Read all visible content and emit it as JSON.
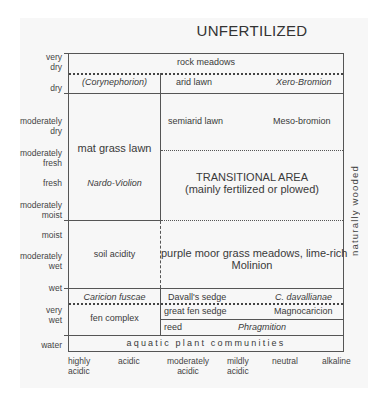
{
  "title": "UNFERTILIZED",
  "side_label": "naturally wooded",
  "y_axis": [
    {
      "label": "very\ndry",
      "line1": "very",
      "line2": "dry"
    },
    {
      "label": "dry"
    },
    {
      "line1": "moderately",
      "line2": "dry"
    },
    {
      "line1": "moderately",
      "line2": "fresh"
    },
    {
      "label": "fresh"
    },
    {
      "line1": "moderately",
      "line2": "moist"
    },
    {
      "label": "moist"
    },
    {
      "line1": "moderately",
      "line2": "wet"
    },
    {
      "label": "wet"
    },
    {
      "line1": "very",
      "line2": "wet"
    },
    {
      "label": "water"
    }
  ],
  "x_axis": [
    {
      "line1": "highly",
      "line2": "acidic"
    },
    {
      "line1": "acidic",
      "line2": ""
    },
    {
      "line1": "moderately",
      "line2": "acidic"
    },
    {
      "line1": "mildly",
      "line2": "acidic"
    },
    {
      "line1": "neutral",
      "line2": ""
    },
    {
      "line1": "alkaline",
      "line2": ""
    }
  ],
  "cells": {
    "rock_meadows": "rock meadows",
    "corynephorion": "(Corynephorion)",
    "arid_lawn": "arid lawn",
    "xero_bromion": "Xero-Bromion",
    "semiarid_lawn": "semiarid lawn",
    "meso_bromion": "Meso-bromion",
    "mat_grass_lawn": "mat grass lawn",
    "nardo_violion": "Nardo-Violion",
    "transitional_title": "TRANSITIONAL AREA",
    "transitional_sub": "(mainly fertilized or plowed)",
    "soil_acidity": "soil acidity",
    "purple_moor_1": "purple moor grass meadows, lime-rich",
    "purple_moor_2": "Molinion",
    "caricion_fuscae": "Caricion fuscae",
    "davalls_sedge": "Davall's sedge",
    "c_davallianae": "C. davallianae",
    "fen_complex": "fen complex",
    "great_fen_sedge": "great fen sedge",
    "magnocaricion": "Magnocaricion",
    "reed": "reed",
    "phragmition": "Phragmition",
    "aquatic": "aquatic plant communities"
  }
}
